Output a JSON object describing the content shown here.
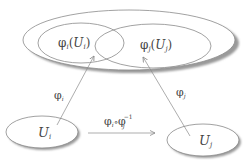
{
  "diagram": {
    "type": "manifold-chart-transition",
    "colors": {
      "stroke": "#8a8a8a",
      "shadow": "#9a9a9a",
      "text": "#444444",
      "fill": "#ffffff"
    },
    "nodes": {
      "image_i": {
        "label": "φ",
        "sub": "i",
        "arg": "U",
        "arg_sub": "i"
      },
      "image_j": {
        "label": "φ",
        "sub": "j",
        "arg": "U",
        "arg_sub": "j"
      },
      "domain_i": {
        "label": "U",
        "sub": "i"
      },
      "domain_j": {
        "label": "U",
        "sub": "j"
      }
    },
    "edges": {
      "phi_i": {
        "label": "φ",
        "sub": "i"
      },
      "phi_j": {
        "label": "φ",
        "sub": "j"
      },
      "transition": {
        "label": "φ",
        "sub": "i",
        "op": "∘",
        "label2": "φ",
        "sub2": "j",
        "sup2": "−1"
      }
    }
  }
}
